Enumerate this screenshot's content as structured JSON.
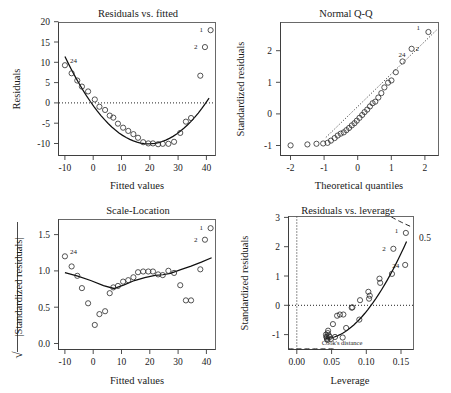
{
  "figure": {
    "kind": "r-regression-diagnostic-plots",
    "panel_count": 4
  },
  "panels": {
    "residuals_vs_fitted": {
      "title": "Residuals vs. fitted",
      "xlabel": "Fitted values",
      "ylabel": "Residuals",
      "xticks": [
        "-10",
        "0",
        "10",
        "20",
        "30",
        "40"
      ],
      "yticks": [
        "-10",
        "-5",
        "0",
        "5",
        "10",
        "15",
        "20"
      ],
      "point_labels": [
        "24",
        "1",
        "2"
      ]
    },
    "normal_qq": {
      "title": "Normal Q-Q",
      "xlabel": "Theoretical quantiles",
      "ylabel": "Standardized residuals",
      "xticks": [
        "-2",
        "-1",
        "0",
        "1",
        "2"
      ],
      "yticks": [
        "-1",
        "0",
        "1",
        "2"
      ],
      "point_labels": [
        "24",
        "1",
        "2"
      ]
    },
    "scale_location": {
      "title": "Scale-Location",
      "xlabel": "Fitted values",
      "ylabel_prefix": "√",
      "ylabel": "|Standardized residuals|",
      "xticks": [
        "-10",
        "0",
        "10",
        "20",
        "30",
        "40"
      ],
      "yticks": [
        "0.0",
        "0.5",
        "1.0",
        "1.5"
      ],
      "point_labels": [
        "24",
        "1",
        "2"
      ]
    },
    "residuals_vs_leverage": {
      "title": "Residuals vs. leverage",
      "xlabel": "Leverage",
      "ylabel": "Standardized residuals",
      "xticks": [
        "0.00",
        "0.05",
        "0.10",
        "0.15"
      ],
      "yticks": [
        "-1",
        "0",
        "1",
        "2",
        "3"
      ],
      "annotation": "Cook's distance",
      "contour_label": "0.5",
      "point_labels": [
        "24",
        "1",
        "2"
      ]
    }
  },
  "chart_data": [
    {
      "type": "scatter",
      "id": "residuals_vs_fitted",
      "title": "Residuals vs. fitted",
      "xlabel": "Fitted values",
      "ylabel": "Residuals",
      "xlim": [
        -13.5,
        47.5
      ],
      "ylim": [
        -11.5,
        21.5
      ],
      "grid": false,
      "zero_reference_line": 0,
      "x": [
        -11.0,
        -8.4,
        -6.2,
        -4.4,
        -2.0,
        0.6,
        2.4,
        4.6,
        6.4,
        7.8,
        9.6,
        11.6,
        13.6,
        15.6,
        17.4,
        19.4,
        21.4,
        23.2,
        25.2,
        27.0,
        29.2,
        31.4,
        33.8,
        36.0,
        38.0,
        41.6,
        45.6,
        43.4
      ],
      "y": [
        10.9,
        8.9,
        7.1,
        5.6,
        4.4,
        2.4,
        0.6,
        -0.2,
        -1.6,
        -2.1,
        -3.6,
        -4.6,
        -5.4,
        -6.2,
        -7.1,
        -8.2,
        -8.5,
        -8.5,
        -8.7,
        -8.6,
        -8.6,
        -8.1,
        -5.9,
        -3.1,
        -2.2,
        8.3,
        19.6,
        15.4
      ],
      "smooth_curve": "quadratic-loess",
      "labeled_points": [
        {
          "label": "24",
          "x": -11.0,
          "y": 10.9
        },
        {
          "label": "1",
          "x": 45.6,
          "y": 19.6
        },
        {
          "label": "2",
          "x": 43.4,
          "y": 15.4
        }
      ]
    },
    {
      "type": "scatter",
      "id": "normal_qq",
      "title": "Normal Q-Q",
      "xlabel": "Theoretical quantiles",
      "ylabel": "Standardized residuals",
      "xlim": [
        -2.35,
        2.35
      ],
      "ylim": [
        -1.35,
        2.85
      ],
      "grid": false,
      "reference_line": "qq-dotted-diagonal",
      "x": [
        -2.05,
        -1.55,
        -1.28,
        -1.08,
        -0.95,
        -0.85,
        -0.74,
        -0.65,
        -0.56,
        -0.47,
        -0.39,
        -0.31,
        -0.23,
        -0.15,
        -0.08,
        0.0,
        0.08,
        0.15,
        0.23,
        0.31,
        0.39,
        0.47,
        0.56,
        0.65,
        0.74,
        0.85,
        0.95,
        1.08,
        1.28,
        1.55,
        2.05
      ],
      "y": [
        -1.03,
        -1.0,
        -0.98,
        -0.97,
        -0.95,
        -0.88,
        -0.8,
        -0.72,
        -0.66,
        -0.62,
        -0.55,
        -0.48,
        -0.4,
        -0.33,
        -0.25,
        -0.16,
        -0.07,
        0.02,
        0.1,
        0.2,
        0.3,
        0.35,
        0.48,
        0.62,
        0.8,
        0.95,
        1.02,
        1.28,
        1.62,
        2.02,
        2.55
      ],
      "labeled_points": [
        {
          "label": "1",
          "x": 2.05,
          "y": 2.55
        },
        {
          "label": "2",
          "x": 1.55,
          "y": 2.02
        },
        {
          "label": "24",
          "x": 1.28,
          "y": 1.62
        }
      ]
    },
    {
      "type": "scatter",
      "id": "scale_location",
      "title": "Scale-Location",
      "xlabel": "Fitted values",
      "ylabel": "sqrt(|Standardized residuals|)",
      "xlim": [
        -13.5,
        47.5
      ],
      "ylim": [
        -0.08,
        1.72
      ],
      "grid": false,
      "x": [
        -11.0,
        -8.4,
        -6.2,
        -4.4,
        -2.0,
        0.6,
        2.4,
        4.6,
        6.4,
        7.8,
        9.6,
        11.6,
        13.6,
        15.6,
        17.4,
        19.4,
        21.4,
        23.2,
        25.2,
        27.0,
        29.2,
        31.4,
        33.8,
        36.0,
        38.0,
        41.6,
        45.6,
        43.4
      ],
      "y": [
        1.21,
        1.07,
        0.94,
        0.77,
        0.56,
        0.26,
        0.41,
        0.45,
        0.7,
        0.78,
        0.8,
        0.86,
        0.88,
        0.92,
        0.99,
        1.0,
        1.0,
        1.0,
        0.96,
        0.95,
        1.01,
        0.98,
        0.81,
        0.6,
        0.6,
        1.03,
        1.6,
        1.44
      ],
      "smooth_curve": "v-shaped-loess",
      "labeled_points": [
        {
          "label": "24",
          "x": -11.0,
          "y": 1.21
        },
        {
          "label": "1",
          "x": 45.6,
          "y": 1.6
        },
        {
          "label": "2",
          "x": 43.4,
          "y": 1.44
        }
      ]
    },
    {
      "type": "scatter",
      "id": "residuals_vs_leverage",
      "title": "Residuals vs. leverage",
      "xlabel": "Leverage",
      "ylabel": "Standardized residuals",
      "xlim": [
        -0.012,
        0.168
      ],
      "ylim": [
        -1.35,
        3.1
      ],
      "grid": false,
      "zero_reference_line": 0,
      "cooks_distance_contour": 0.5,
      "x": [
        0.042,
        0.0425,
        0.043,
        0.0435,
        0.044,
        0.0445,
        0.045,
        0.046,
        0.0475,
        0.049,
        0.052,
        0.055,
        0.058,
        0.062,
        0.066,
        0.067,
        0.071,
        0.079,
        0.08,
        0.09,
        0.091,
        0.103,
        0.104,
        0.105,
        0.119,
        0.12,
        0.137,
        0.139,
        0.156,
        0.157
      ],
      "y": [
        -0.85,
        -0.92,
        -0.95,
        -1.0,
        -1.03,
        -0.8,
        -0.72,
        -0.88,
        -0.93,
        -1.0,
        -0.5,
        -0.93,
        -0.22,
        -0.18,
        -0.95,
        -0.18,
        -0.63,
        0.05,
        0.06,
        -0.35,
        0.3,
        0.58,
        0.35,
        0.45,
        1.02,
        0.88,
        1.18,
        2.02,
        1.48,
        2.55
      ],
      "labeled_points": [
        {
          "label": "1",
          "x": 0.157,
          "y": 2.55
        },
        {
          "label": "2",
          "x": 0.139,
          "y": 2.02
        },
        {
          "label": "24",
          "x": 0.156,
          "y": 1.48
        }
      ]
    }
  ]
}
